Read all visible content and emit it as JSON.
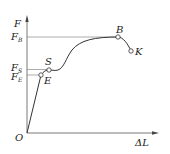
{
  "diagram": {
    "axes": {
      "y_label": "F",
      "x_label": "ΔL",
      "origin_label": "O"
    },
    "levels": [
      {
        "name": "F",
        "sub": "B",
        "y": 37
      },
      {
        "name": "F",
        "sub": "S",
        "y": 69
      },
      {
        "name": "F",
        "sub": "E",
        "y": 75
      }
    ],
    "points": [
      {
        "label": "E",
        "x": 41,
        "y": 75
      },
      {
        "label": "S",
        "x": 49,
        "y": 70
      },
      {
        "label": "B",
        "x": 118,
        "y": 37
      },
      {
        "label": "K",
        "x": 131,
        "y": 51
      }
    ],
    "colors": {
      "line": "#333333",
      "text": "#222222"
    }
  }
}
